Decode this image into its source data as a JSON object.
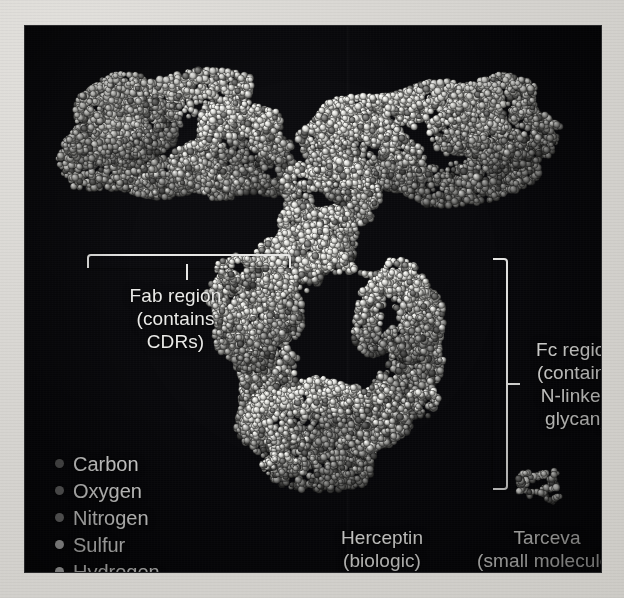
{
  "figure": {
    "background_color": "#07070a",
    "page_color": "#d9d7d3",
    "annotation_color": "#e9e9e7",
    "style": "grayscale space-filling (CPK) molecular rendering"
  },
  "annotations": {
    "fab": {
      "label": "Fab region\n(contains\nCDRs)",
      "lines": [
        "Fab region",
        "(contains",
        "CDRs)"
      ],
      "brace": "horizontal-brace-down"
    },
    "fc": {
      "label": "Fc region\n(contains\nN-linked\nglycan)",
      "lines": [
        "Fc region",
        "(contains",
        "N-linked",
        "glycan)"
      ],
      "brace": "vertical-brace-right"
    }
  },
  "captions": {
    "herceptin": {
      "name": "Herceptin",
      "qualifier": "(biologic)",
      "text": "Herceptin\n(biologic)"
    },
    "tarceva": {
      "name": "Tarceva",
      "qualifier": "(small molecule)",
      "text": "Tarceva\n(small molecule)"
    }
  },
  "legend": {
    "title": "",
    "items": [
      {
        "label": "Carbon",
        "color": "#5a5a5a"
      },
      {
        "label": "Oxygen",
        "color": "#6e6e6e"
      },
      {
        "label": "Nitrogen",
        "color": "#7d7d7d"
      },
      {
        "label": "Sulfur",
        "color": "#cfcfcf"
      },
      {
        "label": "Hydrogen",
        "color": "#ededed"
      }
    ]
  },
  "molecules": {
    "herceptin": {
      "description": "IgG1 antibody space-filling model, Y/T shaped: two Fab arms across the top and an Fc ring with a central cavity below",
      "atom_color_light": "#d8d8d4",
      "atom_color_mid": "#9a9a96",
      "atom_color_dark": "#55554f"
    },
    "tarceva": {
      "description": "small molecule (erlotinib) shown at the same scale, tiny cluster of atoms",
      "atom_color_light": "#cfcfcb"
    }
  }
}
